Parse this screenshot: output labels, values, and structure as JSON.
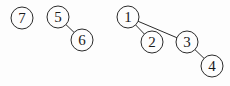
{
  "diagram": {
    "type": "forest",
    "nodes": [
      {
        "id": "7",
        "label": "7",
        "x": 22,
        "y": 18
      },
      {
        "id": "5",
        "label": "5",
        "x": 58,
        "y": 17
      },
      {
        "id": "6",
        "label": "6",
        "x": 82,
        "y": 40
      },
      {
        "id": "1",
        "label": "1",
        "x": 128,
        "y": 17
      },
      {
        "id": "2",
        "label": "2",
        "x": 152,
        "y": 42
      },
      {
        "id": "3",
        "label": "3",
        "x": 187,
        "y": 42
      },
      {
        "id": "4",
        "label": "4",
        "x": 212,
        "y": 66
      }
    ],
    "edges": [
      {
        "from": "5",
        "to": "6"
      },
      {
        "from": "1",
        "to": "2"
      },
      {
        "from": "1",
        "to": "3"
      },
      {
        "from": "3",
        "to": "4"
      }
    ]
  }
}
